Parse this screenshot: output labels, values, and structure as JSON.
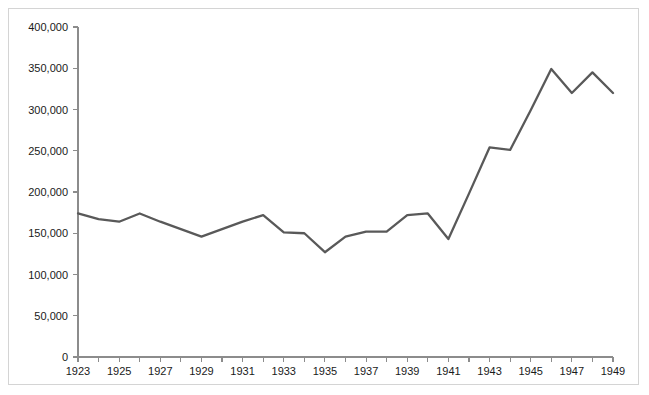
{
  "chart_data": {
    "type": "line",
    "title": "",
    "subtitle": "",
    "xlabel": "",
    "ylabel": "",
    "x": [
      1923,
      1924,
      1925,
      1926,
      1927,
      1928,
      1929,
      1930,
      1931,
      1932,
      1933,
      1934,
      1935,
      1936,
      1937,
      1938,
      1939,
      1940,
      1941,
      1942,
      1943,
      1944,
      1945,
      1946,
      1947,
      1948,
      1949
    ],
    "values": [
      174000,
      167000,
      164000,
      174000,
      164000,
      155000,
      146000,
      155000,
      164000,
      172000,
      151000,
      150000,
      127000,
      146000,
      152000,
      152000,
      172000,
      174000,
      143000,
      198000,
      254000,
      251000,
      299000,
      349000,
      320000,
      345000,
      320000
    ],
    "series": [
      {
        "name": "series-1",
        "color": "#595959",
        "values": [
          174000,
          167000,
          164000,
          174000,
          164000,
          155000,
          146000,
          155000,
          164000,
          172000,
          151000,
          150000,
          127000,
          146000,
          152000,
          152000,
          172000,
          174000,
          143000,
          198000,
          254000,
          251000,
          299000,
          349000,
          320000,
          345000,
          320000
        ]
      }
    ],
    "xlim": [
      1923,
      1949
    ],
    "ylim": [
      0,
      400000
    ],
    "y_ticks": [
      0,
      50000,
      100000,
      150000,
      200000,
      250000,
      300000,
      350000,
      400000
    ],
    "y_tick_labels": [
      "0",
      "50,000",
      "100,000",
      "150,000",
      "200,000",
      "250,000",
      "300,000",
      "350,000",
      "400,000"
    ],
    "x_ticks": [
      1923,
      1924,
      1925,
      1926,
      1927,
      1928,
      1929,
      1930,
      1931,
      1932,
      1933,
      1934,
      1935,
      1936,
      1937,
      1938,
      1939,
      1940,
      1941,
      1942,
      1943,
      1944,
      1945,
      1946,
      1947,
      1948,
      1949
    ],
    "x_tick_labels": [
      "1923",
      "",
      "1925",
      "",
      "1927",
      "",
      "1929",
      "",
      "1931",
      "",
      "1933",
      "",
      "1935",
      "",
      "1937",
      "",
      "1939",
      "",
      "1941",
      "",
      "1943",
      "",
      "1945",
      "",
      "1947",
      "",
      "1949"
    ],
    "grid": false,
    "legend": false,
    "legend_position": "none",
    "annotations": []
  },
  "style": {
    "background": "#ffffff",
    "frame_color": "#d4d4d4",
    "axis_color": "#8c8c8c",
    "line_color": "#595959",
    "text_color": "#1a1a1a"
  }
}
